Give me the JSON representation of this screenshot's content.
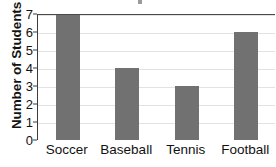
{
  "chart_data": {
    "type": "bar",
    "title": "",
    "xlabel": "",
    "ylabel": "Number of Students",
    "categories": [
      "Soccer",
      "Baseball",
      "Tennis",
      "Football"
    ],
    "values": [
      7,
      4,
      3,
      6
    ],
    "ylim": [
      0,
      7
    ],
    "ytick_labels": [
      "0",
      "1",
      "2",
      "3",
      "4",
      "5",
      "6",
      "7"
    ],
    "grid": "horizontal",
    "legend": "none",
    "bar_color": "#717171",
    "gridline_color": "#e2e2e2",
    "axis_color": "#4a4a4a",
    "text_color": "#121212",
    "background_color": "#ffffff"
  },
  "notes": {
    "title_cropped": "title cut off above top edge",
    "last_label_clipped": "Football clipped at right edge"
  }
}
